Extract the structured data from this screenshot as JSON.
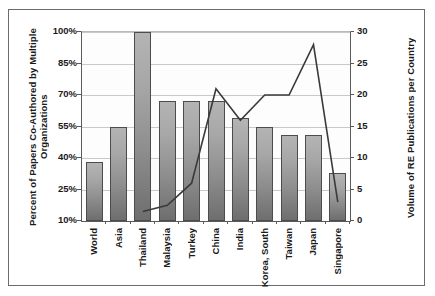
{
  "chart_data": {
    "type": "bar",
    "title": "",
    "xlabel": "",
    "ylabel": "Percent of Papers Co-Authored by Multiple Organizations",
    "y2label": "Volume of RE Publications per Country",
    "grid": true,
    "legend": "none",
    "ylim": [
      10,
      100
    ],
    "y2lim": [
      0,
      30
    ],
    "yticks": [
      "10%",
      "25%",
      "40%",
      "55%",
      "70%",
      "85%",
      "100%"
    ],
    "y2ticks": [
      "0",
      "5",
      "10",
      "15",
      "20",
      "25",
      "30"
    ],
    "categories": [
      "World",
      "Asia",
      "Thailand",
      "Malaysia",
      "Turkey",
      "China",
      "India",
      "Korea, South",
      "Taiwan",
      "Japan",
      "Singapore"
    ],
    "series": [
      {
        "name": "Percent of Papers Co-Authored by Multiple Organizations",
        "kind": "bar",
        "axis": "left",
        "values": [
          38,
          55,
          100,
          67,
          67,
          67,
          59,
          55,
          51,
          51,
          33
        ]
      },
      {
        "name": "Volume of RE Publications per Country",
        "kind": "line",
        "axis": "right",
        "values": [
          null,
          null,
          1.5,
          2.5,
          6,
          21,
          16,
          20,
          20,
          28,
          3
        ]
      }
    ],
    "colors": {
      "bar_fill_top": "#b4b4b4",
      "bar_fill_bottom": "#6e6e6e",
      "bar_border": "#4c4c4c",
      "line": "#3a3a3a",
      "grid": "#c9c9c9",
      "axis": "#5a5a5a",
      "frame": "#6b6b6b",
      "background": "#ffffff",
      "text": "#1a1a1a"
    }
  }
}
